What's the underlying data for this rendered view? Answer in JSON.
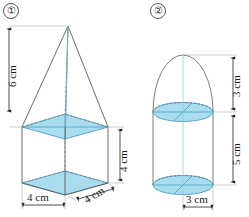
{
  "page": {
    "background": "#ffffff",
    "fill_color": "#a9dcee",
    "stroke_color": "#5b5b5b",
    "accent_line_color": "#4a9ec4"
  },
  "figures": [
    {
      "id": "figure-1",
      "number_label": "①",
      "shape": "square-pyramid-on-square-prism",
      "dimensions": [
        {
          "name": "pyramid-height",
          "text": "6 cm",
          "orientation": "vertical",
          "side": "left"
        },
        {
          "name": "prism-height",
          "text": "4 cm",
          "orientation": "vertical",
          "side": "right"
        },
        {
          "name": "base-width",
          "text": "4 cm",
          "orientation": "horizontal",
          "side": "bottom"
        },
        {
          "name": "base-depth",
          "text": "4 cm",
          "orientation": "diagonal",
          "side": "bottom-right"
        }
      ]
    },
    {
      "id": "figure-2",
      "number_label": "②",
      "shape": "hemisphere-on-cylinder",
      "dimensions": [
        {
          "name": "hemisphere-height",
          "text": "3 cm",
          "orientation": "vertical",
          "side": "right"
        },
        {
          "name": "cylinder-height",
          "text": "5 cm",
          "orientation": "vertical",
          "side": "right"
        },
        {
          "name": "base-radius",
          "text": "3 cm",
          "orientation": "horizontal",
          "side": "bottom"
        }
      ]
    }
  ]
}
